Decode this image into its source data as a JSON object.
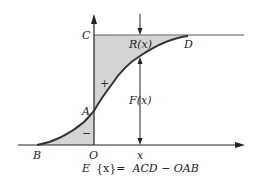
{
  "diagram": {
    "points": {
      "C": "C",
      "A": "A",
      "B": "B",
      "O": "O",
      "D": "D",
      "x": "x"
    },
    "labels": {
      "R": "R(x)",
      "F": "F(x)",
      "plus": "+",
      "minus": "−"
    },
    "formula": {
      "lhs_italic": "E",
      "lhs_brace": "{x}=",
      "rhs": "ACD − OAB"
    },
    "colors": {
      "shade": "#d4d4d4",
      "curve": "#333333",
      "axis": "#222222"
    }
  }
}
